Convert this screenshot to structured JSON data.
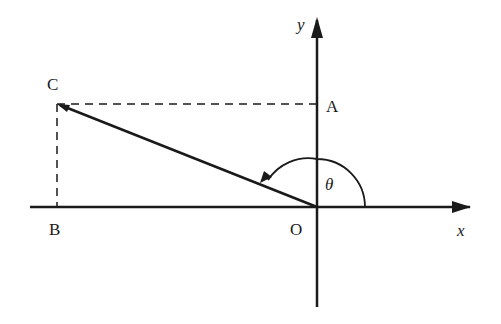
{
  "diagram": {
    "axes": {
      "x_label": "x",
      "y_label": "y"
    },
    "points": {
      "origin": "O",
      "A": "A",
      "B": "B",
      "C": "C"
    },
    "angle_label": "θ",
    "colors": {
      "stroke": "#1a1a1a",
      "background": "#ffffff"
    }
  }
}
